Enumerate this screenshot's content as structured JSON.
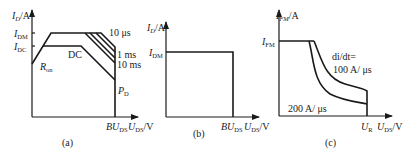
{
  "panels": [
    {
      "id": "a",
      "caption": "(a)",
      "y_axis_label": {
        "main": "I",
        "sub": "D",
        "unit": "/A"
      },
      "x_axis_label": {
        "main": "U",
        "sub": "DS",
        "unit": "/V"
      },
      "x_tick": {
        "main": "BU",
        "sub": "DS"
      },
      "y_ticks": [
        {
          "main": "I",
          "sub": "DM"
        },
        {
          "main": "I",
          "sub": "DC"
        }
      ],
      "curve_labels": {
        "dc": "DC",
        "ron": {
          "main": "R",
          "sub": "on"
        },
        "pd": {
          "main": "P",
          "sub": "D"
        },
        "t1": "10 μs",
        "t2": "1 ms",
        "t3": "10 ms"
      }
    },
    {
      "id": "b",
      "caption": "(b)",
      "y_axis_label": {
        "main": "I",
        "sub": "D",
        "unit": "/A"
      },
      "x_axis_label": {
        "main": "U",
        "sub": "DS",
        "unit": "/V"
      },
      "x_tick": {
        "main": "BU",
        "sub": "DS"
      },
      "y_ticks": [
        {
          "main": "I",
          "sub": "DM"
        }
      ]
    },
    {
      "id": "c",
      "caption": "(c)",
      "y_axis_label": {
        "main": "I",
        "sub": "FM",
        "unit": "/A"
      },
      "x_axis_label": {
        "main": "U",
        "sub": "DS",
        "unit": "/V"
      },
      "x_tick": {
        "main": "U",
        "sub": "R"
      },
      "y_ticks": [
        {
          "main": "I",
          "sub": "FM"
        }
      ],
      "curve_labels": {
        "didt": "di/dt=",
        "c100": "100 A/ μs",
        "c200": "200 A/ μs"
      }
    }
  ]
}
